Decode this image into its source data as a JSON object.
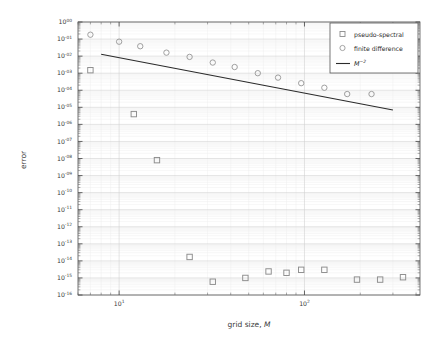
{
  "chart_data": {
    "type": "scatter",
    "title": "",
    "xlabel": "grid size, M",
    "ylabel": "error",
    "xscale": "log",
    "yscale": "log",
    "xlim": [
      6.0,
      420.0
    ],
    "ylim": [
      1e-16,
      1.0
    ],
    "grid": true,
    "grid_minor": true,
    "legend_position": "upper right",
    "xticks": [
      10,
      100
    ],
    "xtick_labels": [
      "10^1",
      "10^2"
    ],
    "ytick_labels": [
      "10^00",
      "10^-01",
      "10^-02",
      "10^-03",
      "10^-04",
      "10^-05",
      "10^-06",
      "10^-07",
      "10^-08",
      "10^-09",
      "10^-10",
      "10^-11",
      "10^-12",
      "10^-13",
      "10^-14",
      "10^-15",
      "10^-16"
    ],
    "ytick_values": [
      1.0,
      0.1,
      0.01,
      0.001,
      0.0001,
      1e-05,
      1e-06,
      1e-07,
      1e-08,
      1e-09,
      1e-10,
      1e-11,
      1e-12,
      1e-13,
      1e-14,
      1e-15,
      1e-16
    ],
    "series": [
      {
        "name": "pseudo-spectral",
        "marker": "square",
        "color": "#8c8c8c",
        "x": [
          7,
          12,
          16,
          24,
          32,
          48,
          64,
          80,
          96,
          128,
          192,
          256,
          340
        ],
        "y": [
          0.0015,
          4e-06,
          8e-09,
          1.7e-14,
          6e-16,
          1e-15,
          2.4e-15,
          2e-15,
          3e-15,
          3e-15,
          8e-16,
          8e-16,
          1.1e-15
        ]
      },
      {
        "name": "finite difference",
        "marker": "circle",
        "color": "#9a9a9a",
        "x": [
          7,
          10,
          13,
          18,
          24,
          32,
          42,
          56,
          72,
          96,
          128,
          170,
          230
        ],
        "y": [
          0.18,
          0.07,
          0.038,
          0.016,
          0.009,
          0.0042,
          0.0023,
          0.001,
          0.00055,
          0.00026,
          0.00014,
          6e-05,
          6e-05
        ]
      }
    ],
    "reference_line": {
      "name": "M^-2",
      "label_base": "M",
      "label_exponent": "−2",
      "color": "#2b2b2b",
      "x": [
        8.0,
        300.0
      ],
      "y": [
        0.013,
        7e-06
      ]
    },
    "legend_entries": [
      {
        "label": "pseudo-spectral",
        "marker": "square"
      },
      {
        "label": "finite difference",
        "marker": "circle"
      },
      {
        "label": "M^-2",
        "marker": "line"
      }
    ]
  }
}
